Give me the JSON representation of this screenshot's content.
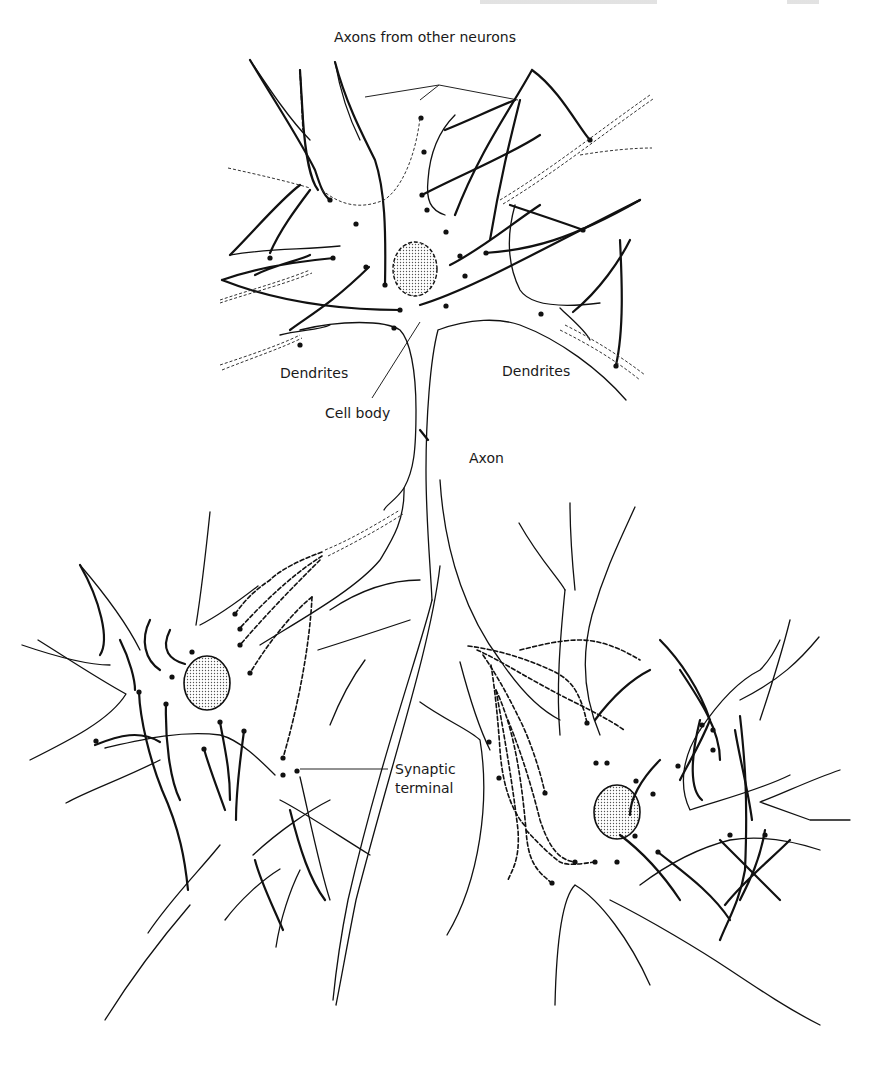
{
  "figure": {
    "type": "neuron-anatomy-line-drawing",
    "labels": {
      "axons_from_other_neurons": "Axons from other neurons",
      "dendrites_left": "Dendrites",
      "dendrites_right": "Dendrites",
      "cell_body": "Cell body",
      "axon": "Axon",
      "synaptic_terminal_line1": "Synaptic",
      "synaptic_terminal_line2": "terminal"
    },
    "cells": [
      {
        "name": "upper-neuron",
        "nucleus": "stippled-oval-dashed-outline"
      },
      {
        "name": "lower-left-neuron",
        "nucleus": "stippled-oval"
      },
      {
        "name": "lower-right-neuron",
        "nucleus": "stippled-oval"
      }
    ]
  },
  "colors": {
    "ink": "#111111",
    "paper": "#ffffff",
    "nucleus_fill": "#d8d8d8"
  }
}
